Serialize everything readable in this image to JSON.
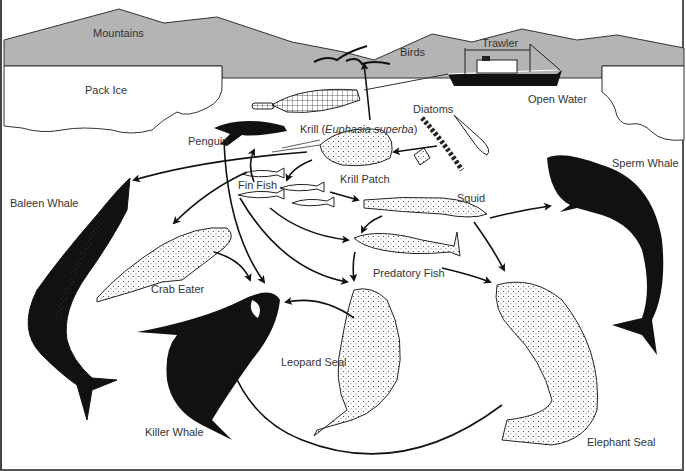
{
  "colors": {
    "mountain_fill": "#b4b4b4",
    "outline": "#222222",
    "animal_dark": "#141414",
    "label_text": "#333333",
    "background": "#ffffff"
  },
  "labels": {
    "mountains": "Mountains",
    "birds": "Birds",
    "trawler": "Trawler",
    "pack_ice": "Pack Ice",
    "open_water": "Open Water",
    "diatoms": "Diatoms",
    "penguin": "Penguin",
    "krill_prefix": "Krill (",
    "krill_species": "Euphasia superba",
    "krill_suffix": ")",
    "krill_patch": "Krill Patch",
    "fin_fish": "Fin Fish",
    "squid": "Squid",
    "sperm_whale": "Sperm Whale",
    "baleen_whale": "Baleen Whale",
    "crab_eater": "Crab Eater",
    "predatory_fish": "Predatory Fish",
    "leopard_seal": "Leopard  Seal",
    "killer_whale": "Killer Whale",
    "elephant_seal": "Elephant Seal"
  },
  "food_web_links": [
    {
      "from": "Diatoms",
      "to": "Krill"
    },
    {
      "from": "Krill",
      "to": "Birds"
    },
    {
      "from": "Krill",
      "to": "Penguin"
    },
    {
      "from": "Krill",
      "to": "Fin Fish"
    },
    {
      "from": "Krill",
      "to": "Baleen Whale"
    },
    {
      "from": "Krill",
      "to": "Crab Eater"
    },
    {
      "from": "Krill",
      "to": "Squid"
    },
    {
      "from": "Fin Fish",
      "to": "Squid"
    },
    {
      "from": "Fin Fish",
      "to": "Predatory Fish"
    },
    {
      "from": "Fin Fish",
      "to": "Leopard Seal"
    },
    {
      "from": "Squid",
      "to": "Predatory Fish"
    },
    {
      "from": "Squid",
      "to": "Sperm Whale"
    },
    {
      "from": "Squid",
      "to": "Elephant Seal"
    },
    {
      "from": "Predatory Fish",
      "to": "Leopard Seal"
    },
    {
      "from": "Predatory Fish",
      "to": "Elephant Seal"
    },
    {
      "from": "Penguin",
      "to": "Killer Whale"
    },
    {
      "from": "Crab Eater",
      "to": "Killer Whale"
    },
    {
      "from": "Leopard Seal",
      "to": "Killer Whale"
    },
    {
      "from": "Elephant Seal",
      "to": "Killer Whale"
    }
  ]
}
